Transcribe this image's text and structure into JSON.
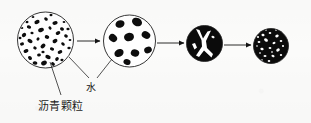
{
  "figure": {
    "type": "process-diagram",
    "background_color": "#fbfbfa",
    "ink_color": "#111111",
    "stages": [
      {
        "id": "stage-1",
        "name": "dispersed-asphalt-particles",
        "fill": "white",
        "outline": "#1a1a1a",
        "center": [
          45.5,
          40
        ],
        "radius": 28,
        "particle_count": 42,
        "particle_style": "small-irregular-black-specks"
      },
      {
        "id": "stage-2",
        "name": "coalescing-asphalt-droplets",
        "fill": "white",
        "outline": "#1a1a1a",
        "center": [
          129.5,
          41
        ],
        "radius": 26,
        "particle_count": 9,
        "particle_style": "large-rounded-black-blobs"
      },
      {
        "id": "stage-3",
        "name": "continuous-asphalt-film-with-water-channels",
        "fill": "black",
        "outline": "#1a1a1a",
        "center": [
          204.5,
          43.5
        ],
        "radius": 18,
        "particle_count": 0,
        "particle_style": "white-y-shaped-channels"
      },
      {
        "id": "stage-4",
        "name": "cured-asphalt-film-residual-voids",
        "fill": "black",
        "outline": "#1a1a1a",
        "center": [
          271,
          46
        ],
        "radius": 17.5,
        "particle_count": 22,
        "particle_style": "small-white-speckles"
      }
    ],
    "arrows": [
      {
        "id": "arrow-1",
        "from": "stage-1",
        "to": "stage-2",
        "x1": 77,
        "y1": 41,
        "x2": 101,
        "y2": 41
      },
      {
        "id": "arrow-2",
        "from": "stage-2",
        "to": "stage-3",
        "x1": 157,
        "y1": 43,
        "x2": 185,
        "y2": 43
      },
      {
        "id": "arrow-3",
        "from": "stage-3",
        "to": "stage-4",
        "x1": 224,
        "y1": 45,
        "x2": 252,
        "y2": 45
      }
    ],
    "labels": [
      {
        "id": "label-asphalt-particles",
        "text": "沥青颗粒",
        "x": 38,
        "y": 97,
        "leader": {
          "x1": 50,
          "y1": 62,
          "x2": 61,
          "y2": 95
        }
      },
      {
        "id": "label-water",
        "text": "水",
        "x": 86,
        "y": 79,
        "leaders": [
          {
            "x1": 69,
            "y1": 58,
            "x2": 88,
            "y2": 78
          },
          {
            "x1": 112,
            "y1": 60,
            "x2": 97,
            "y2": 78
          }
        ]
      }
    ]
  }
}
